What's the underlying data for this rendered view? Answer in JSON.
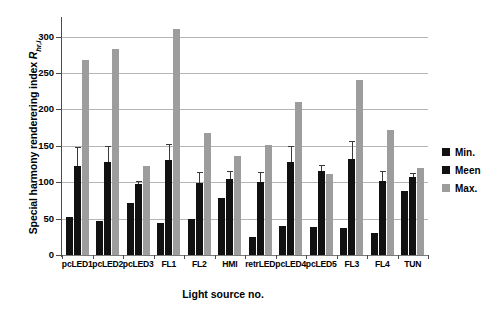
{
  "chart_data": {
    "type": "bar",
    "title": "",
    "xlabel": "Light source no.",
    "ylabel_prefix": "Special harmony renderering index ",
    "ylabel_symbol": "R",
    "ylabel_subscript": "hr,i",
    "ylim": [
      0,
      320
    ],
    "yticks": [
      0,
      50,
      100,
      150,
      200,
      250,
      300
    ],
    "ytick_labels": [
      "0",
      "50",
      "100",
      "150",
      "200",
      "250",
      "300"
    ],
    "grid": true,
    "legend_position": "right",
    "categories": [
      "pcLED1",
      "pcLED2",
      "pcLED3",
      "FL1",
      "FL2",
      "HMI",
      "retrLED",
      "pcLED4",
      "pcLED5",
      "FL3",
      "FL4",
      "TUN"
    ],
    "series": [
      {
        "name": "Min.",
        "color": "#111111",
        "values": [
          52,
          47,
          72,
          44,
          50,
          78,
          25,
          40,
          38,
          37,
          30,
          88
        ]
      },
      {
        "name": "Meen",
        "color": "#111111",
        "values": [
          122,
          128,
          97,
          130,
          99,
          104,
          100,
          128,
          116,
          132,
          102,
          107
        ],
        "err_high": [
          27,
          22,
          5,
          22,
          15,
          11,
          14,
          22,
          7,
          24,
          13,
          6
        ]
      },
      {
        "name": "Max.",
        "color": "#9d9d9d",
        "values": [
          268,
          283,
          122,
          311,
          167,
          136,
          151,
          210,
          111,
          240,
          172,
          119
        ]
      }
    ]
  },
  "legend": {
    "items": [
      {
        "label": "Min.",
        "color": "#111111"
      },
      {
        "label": "Meen",
        "color": "#111111"
      },
      {
        "label": "Max.",
        "color": "#9d9d9d"
      }
    ]
  }
}
